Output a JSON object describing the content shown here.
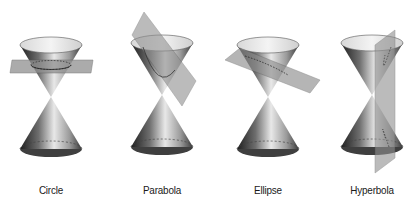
{
  "diagram": {
    "panels": [
      {
        "id": "circle",
        "label": "Circle",
        "cx": 51,
        "plane": "horizontal"
      },
      {
        "id": "parabola",
        "label": "Parabola",
        "cx": 162,
        "plane": "parallel-to-side"
      },
      {
        "id": "ellipse",
        "label": "Ellipse",
        "cx": 268,
        "plane": "tilted"
      },
      {
        "id": "hyperbola",
        "label": "Hyperbola",
        "cx": 372,
        "plane": "vertical"
      }
    ]
  },
  "colors": {
    "background": "#ffffff",
    "cone_dark": "#1e1e1e",
    "cone_mid": "#8a8a8a",
    "cone_light": "#e6e6e6",
    "plane": "#8f8f8f",
    "label": "#1a1a1a"
  }
}
